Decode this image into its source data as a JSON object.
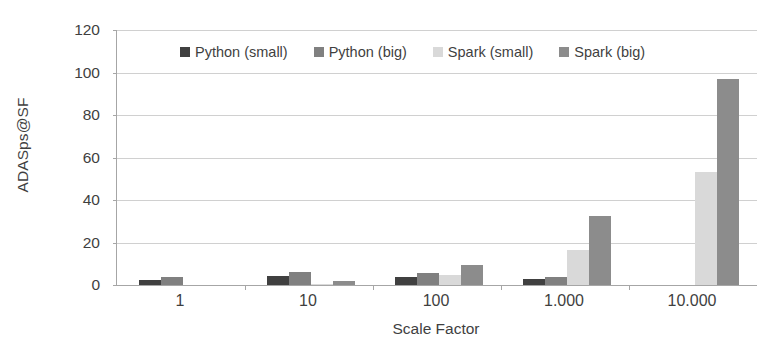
{
  "chart_data": {
    "type": "bar",
    "title": "",
    "subtitle": "",
    "xlabel": "Scale Factor",
    "ylabel": "ADASps@SF",
    "categories": [
      "1",
      "10",
      "100",
      "1.000",
      "10.000"
    ],
    "series": [
      {
        "name": "Python (small)",
        "color": "#404040",
        "values": [
          2.4,
          4.2,
          4.0,
          3.0,
          0
        ]
      },
      {
        "name": "Python (big)",
        "color": "#808080",
        "values": [
          4.0,
          6.2,
          5.8,
          4.0,
          0
        ]
      },
      {
        "name": "Spark (small)",
        "color": "#d9d9d9",
        "values": [
          0,
          0.3,
          4.6,
          16.5,
          53.0
        ]
      },
      {
        "name": "Spark (big)",
        "color": "#8c8c8c",
        "values": [
          0,
          1.8,
          9.2,
          32.5,
          97.0
        ]
      }
    ],
    "ylim": [
      0,
      120
    ],
    "yticks": [
      0,
      20,
      40,
      60,
      80,
      100,
      120
    ],
    "ytick_labels": [
      "0",
      "20",
      "40",
      "60",
      "80",
      "100",
      "120"
    ],
    "grid": true,
    "grid_axis": "y",
    "legend_position": "top",
    "legend": [
      "Python (small)",
      "Python (big)",
      "Spark (small)",
      "Spark (big)"
    ],
    "axis_color": "#a6a6a6",
    "gridline_color": "#d0d0d0",
    "background": "#ffffff",
    "text_color": "#3f3f3f"
  }
}
